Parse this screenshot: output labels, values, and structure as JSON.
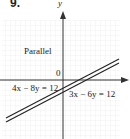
{
  "problem_number": "9.",
  "axes": {
    "x_label": "",
    "y_label": "y",
    "origin_label": "0"
  },
  "annotation": "Parallel",
  "lines": [
    {
      "equation": "4x − 8y = 12"
    },
    {
      "equation": "3x − 6y = 12"
    }
  ],
  "colors": {
    "grid": "#e6e6e6",
    "axis": "#333333",
    "line": "#222222"
  }
}
